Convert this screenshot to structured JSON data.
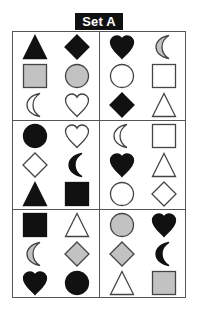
{
  "title": "Set A",
  "colors": {
    "black": "#111111",
    "gray": "#c2c2c2",
    "white": "#ffffff",
    "stroke": "#444444",
    "border": "#555555"
  },
  "panels": [
    {
      "position": "top-left",
      "shapes": [
        {
          "shape": "triangle",
          "fill": "black"
        },
        {
          "shape": "diamond",
          "fill": "black"
        },
        {
          "shape": "square",
          "fill": "gray"
        },
        {
          "shape": "circle",
          "fill": "gray"
        },
        {
          "shape": "crescent",
          "fill": "white"
        },
        {
          "shape": "heart",
          "fill": "white"
        }
      ]
    },
    {
      "position": "top-right",
      "shapes": [
        {
          "shape": "heart",
          "fill": "black"
        },
        {
          "shape": "crescent",
          "fill": "gray"
        },
        {
          "shape": "circle",
          "fill": "white"
        },
        {
          "shape": "square",
          "fill": "white"
        },
        {
          "shape": "diamond",
          "fill": "black"
        },
        {
          "shape": "triangle",
          "fill": "white"
        }
      ]
    },
    {
      "position": "middle-left",
      "shapes": [
        {
          "shape": "circle",
          "fill": "black"
        },
        {
          "shape": "heart",
          "fill": "white"
        },
        {
          "shape": "diamond",
          "fill": "white"
        },
        {
          "shape": "crescent",
          "fill": "black"
        },
        {
          "shape": "triangle",
          "fill": "black"
        },
        {
          "shape": "square",
          "fill": "black"
        }
      ]
    },
    {
      "position": "middle-right",
      "shapes": [
        {
          "shape": "crescent",
          "fill": "white"
        },
        {
          "shape": "square",
          "fill": "white"
        },
        {
          "shape": "heart",
          "fill": "black"
        },
        {
          "shape": "triangle",
          "fill": "white"
        },
        {
          "shape": "circle",
          "fill": "white"
        },
        {
          "shape": "diamond",
          "fill": "white"
        }
      ]
    },
    {
      "position": "bottom-left",
      "shapes": [
        {
          "shape": "square",
          "fill": "black"
        },
        {
          "shape": "triangle",
          "fill": "white"
        },
        {
          "shape": "crescent",
          "fill": "gray"
        },
        {
          "shape": "diamond",
          "fill": "gray"
        },
        {
          "shape": "heart",
          "fill": "black"
        },
        {
          "shape": "circle",
          "fill": "black"
        }
      ]
    },
    {
      "position": "bottom-right",
      "shapes": [
        {
          "shape": "circle",
          "fill": "gray"
        },
        {
          "shape": "heart",
          "fill": "black"
        },
        {
          "shape": "diamond",
          "fill": "gray"
        },
        {
          "shape": "crescent",
          "fill": "black"
        },
        {
          "shape": "triangle",
          "fill": "white"
        },
        {
          "shape": "square",
          "fill": "gray"
        }
      ]
    }
  ]
}
